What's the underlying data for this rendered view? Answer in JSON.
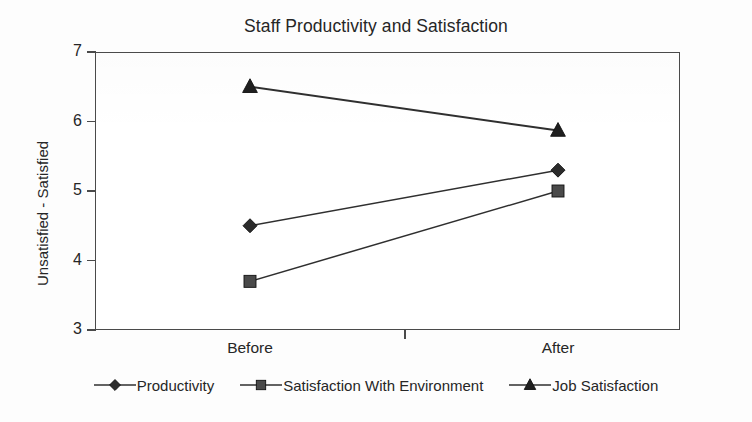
{
  "chart_data": {
    "type": "line",
    "title": "Staff Productivity and Satisfaction",
    "xlabel": "",
    "ylabel": "Unsatisfied - Satisfied",
    "categories": [
      "Before",
      "After"
    ],
    "ylim": [
      3,
      7
    ],
    "yticks": [
      3,
      4,
      5,
      6,
      7
    ],
    "ytick_labels": [
      "3",
      "4",
      "5",
      "6",
      "7"
    ],
    "grid": false,
    "legend_position": "bottom",
    "series": [
      {
        "name": "Productivity",
        "marker": "diamond",
        "color": "#2b2b2b",
        "values": [
          4.5,
          5.3
        ]
      },
      {
        "name": "Satisfaction With Environment",
        "marker": "square",
        "color": "#4a4a4a",
        "values": [
          3.7,
          5.0
        ]
      },
      {
        "name": "Job Satisfaction",
        "marker": "triangle",
        "color": "#1f1f1f",
        "values": [
          6.5,
          5.87
        ]
      }
    ]
  },
  "axis": {
    "y_labels": [
      "7",
      "6",
      "5",
      "4",
      "3"
    ],
    "x_labels": [
      "Before",
      "After"
    ]
  },
  "legend": {
    "items": [
      {
        "label": "Productivity",
        "marker": "diamond"
      },
      {
        "label": "Satisfaction With Environment",
        "marker": "square"
      },
      {
        "label": "Job Satisfaction",
        "marker": "triangle"
      }
    ]
  },
  "colors": {
    "line": "#2f2f2f",
    "axis": "#4a4a4a",
    "text": "#262626",
    "background": "#fdfdfd",
    "plot_background": "#ffffff"
  }
}
